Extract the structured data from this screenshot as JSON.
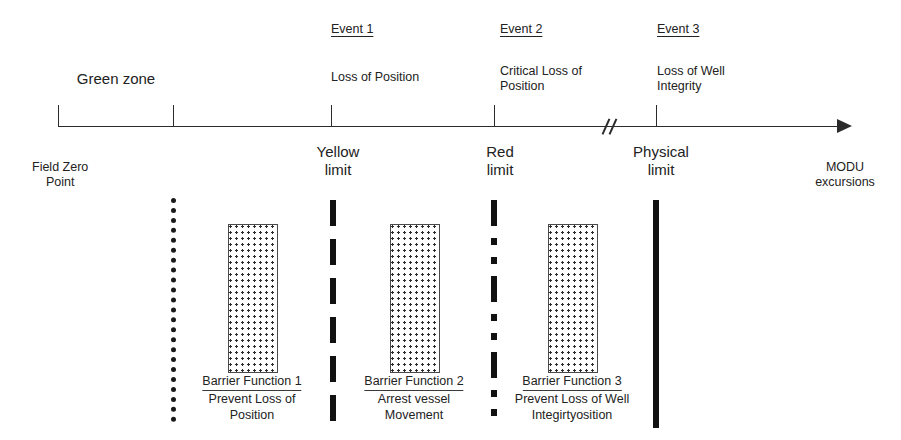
{
  "diagram": {
    "axis": {
      "start_label": "Field Zero\nPoint",
      "end_label": "MODU\nexcursions",
      "zone_label": "Green zone",
      "has_break": true,
      "arrow_direction": "right"
    },
    "events": [
      {
        "id": "event-1",
        "title": "Event 1",
        "description": "Loss of Position",
        "limit_label": "Yellow\nlimit",
        "limit_style": "dashed",
        "x": 331
      },
      {
        "id": "event-2",
        "title": "Event 2",
        "description": "Critical Loss of\nPosition",
        "limit_label": "Red\nlimit",
        "limit_style": "dash-dot",
        "x": 494
      },
      {
        "id": "event-3",
        "title": "Event 3",
        "description": "Loss of Well\nIntegrity",
        "limit_label": "Physical\nlimit",
        "limit_style": "solid",
        "x": 656
      }
    ],
    "zone_boundary": {
      "id": "zone-boundary",
      "limit_style": "dotted",
      "x": 173
    },
    "barriers": [
      {
        "id": "barrier-1",
        "title": "Barrier Function 1",
        "description": "Prevent Loss of\nPosition",
        "box_x": 228,
        "box_width": 48
      },
      {
        "id": "barrier-2",
        "title": "Barrier Function 2",
        "description": "Arrest vessel\nMovement",
        "box_x": 390,
        "box_width": 48
      },
      {
        "id": "barrier-3",
        "title": "Barrier Function 3",
        "description": "Prevent Loss of Well\nIntegirtyosition",
        "box_x": 548,
        "box_width": 48
      }
    ],
    "colors": {
      "ink": "#222222",
      "line": "#2b2b2b",
      "background": "#ffffff"
    }
  }
}
